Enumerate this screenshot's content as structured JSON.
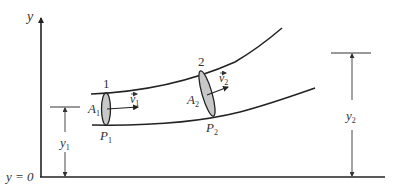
{
  "diagram": {
    "axis": {
      "y_label": "y",
      "origin_label": "y = 0"
    },
    "sections": [
      {
        "id": "1",
        "number_label": "1",
        "area_label": "A",
        "area_sub": "1",
        "velocity_label": "v",
        "velocity_sub": "1",
        "pressure_label": "P",
        "pressure_sub": "1",
        "height_label": "y",
        "height_sub": "1"
      },
      {
        "id": "2",
        "number_label": "2",
        "area_label": "A",
        "area_sub": "2",
        "velocity_label": "v",
        "velocity_sub": "2",
        "pressure_label": "P",
        "pressure_sub": "2",
        "height_label": "y",
        "height_sub": "2"
      }
    ],
    "colors": {
      "line": "#222222",
      "cross_section_fill": "#c8c8c8",
      "text": "#333333",
      "background": "#ffffff"
    }
  }
}
